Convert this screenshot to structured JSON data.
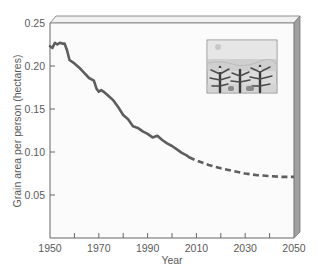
{
  "chart_data": {
    "type": "line",
    "title": "",
    "xlabel": "Year",
    "ylabel": "Grain area per person (hectares)",
    "xlim": [
      1950,
      2050
    ],
    "ylim": [
      0,
      0.25
    ],
    "x_ticks": [
      1950,
      1960,
      1970,
      1980,
      1990,
      2000,
      2010,
      2020,
      2030,
      2040,
      2050
    ],
    "x_tick_labels": [
      "1950",
      "1970",
      "1990",
      "2010",
      "2030",
      "2050"
    ],
    "y_ticks": [
      0.05,
      0.1,
      0.15,
      0.2,
      0.25
    ],
    "y_tick_labels": [
      "0.05",
      "0.10",
      "0.15",
      "0.20",
      "0.25"
    ],
    "grid": false,
    "legend": null,
    "series": [
      {
        "name": "Historical",
        "style": "solid",
        "x": [
          1950,
          1951,
          1952,
          1953,
          1954,
          1955,
          1956,
          1957,
          1958,
          1960,
          1962,
          1964,
          1966,
          1968,
          1969,
          1970,
          1971,
          1972,
          1974,
          1976,
          1978,
          1980,
          1982,
          1984,
          1986,
          1988,
          1990,
          1992,
          1994,
          1996,
          1998,
          2000,
          2002,
          2004,
          2006,
          2007
        ],
        "values": [
          0.223,
          0.221,
          0.227,
          0.225,
          0.227,
          0.226,
          0.226,
          0.218,
          0.207,
          0.203,
          0.198,
          0.192,
          0.186,
          0.183,
          0.174,
          0.17,
          0.172,
          0.17,
          0.165,
          0.16,
          0.152,
          0.143,
          0.138,
          0.13,
          0.128,
          0.124,
          0.121,
          0.117,
          0.119,
          0.114,
          0.11,
          0.107,
          0.103,
          0.099,
          0.096,
          0.094
        ]
      },
      {
        "name": "Projected",
        "style": "dashed",
        "x": [
          2007,
          2010,
          2015,
          2020,
          2025,
          2030,
          2035,
          2040,
          2045,
          2050
        ],
        "values": [
          0.094,
          0.09,
          0.085,
          0.081,
          0.078,
          0.075,
          0.073,
          0.072,
          0.071,
          0.071
        ]
      }
    ],
    "annotations": [
      {
        "type": "inset-image",
        "description": "grain-field-illustration",
        "position": "upper-right"
      }
    ],
    "colors": {
      "line": "#5e5e5e",
      "axis": "#666666",
      "frame_side": "#9a9a9a",
      "frame_top": "#e8e8e8",
      "plot_bg": "#fafafa"
    }
  }
}
